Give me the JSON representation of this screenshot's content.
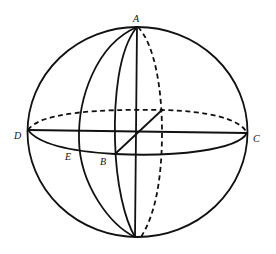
{
  "diagram": {
    "type": "sphere-geometry",
    "labels": {
      "A": "A",
      "B": "B",
      "C": "C",
      "D": "D",
      "E": "E"
    },
    "colors": {
      "line": "#111111",
      "background": "#ffffff"
    }
  }
}
